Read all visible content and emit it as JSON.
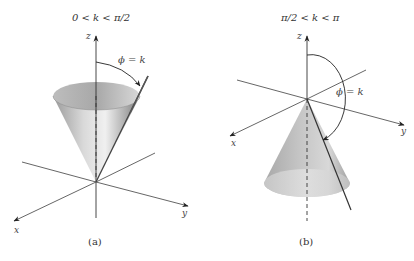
{
  "figure": {
    "panels": [
      {
        "id": "a",
        "title": "0 < k < π/2",
        "caption": "(a)",
        "angle_label": "ϕ = k",
        "axes": {
          "x": "x",
          "y": "y",
          "z": "z"
        },
        "cone_orientation": "opens upward"
      },
      {
        "id": "b",
        "title": "π/2 < k < π",
        "caption": "(b)",
        "angle_label": "ϕ = k",
        "axes": {
          "x": "x",
          "y": "y",
          "z": "z"
        },
        "cone_orientation": "opens downward"
      }
    ],
    "colors": {
      "axis": "#555555",
      "cone_light": "#e6e6e6",
      "cone_dark": "#8f8f8f",
      "text": "#333333"
    }
  }
}
